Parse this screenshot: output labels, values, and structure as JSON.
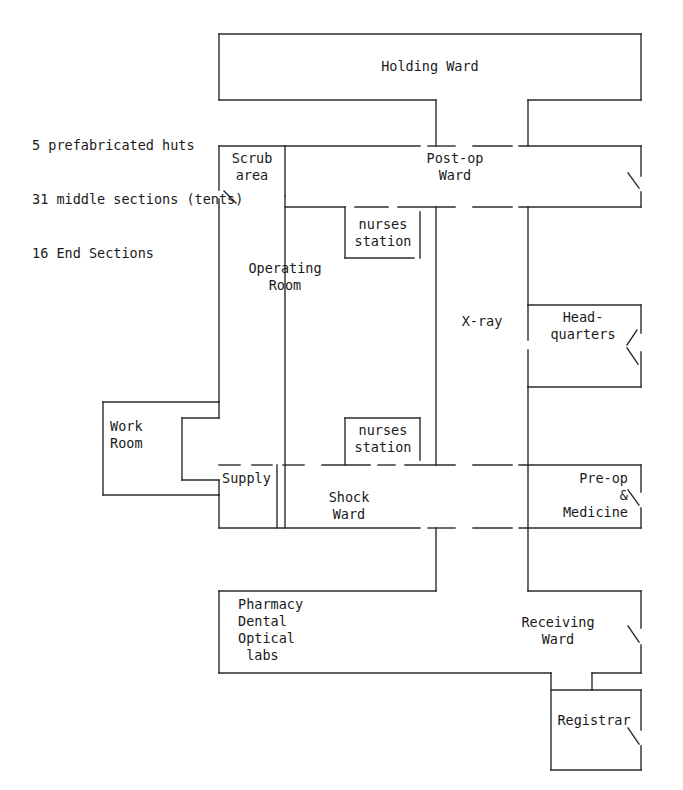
{
  "document": {
    "title": "Hospital Floor Plan",
    "type": "architectural-floor-plan"
  },
  "legend": {
    "lines": [
      "5 prefabricated huts",
      "31 middle sections (tents)",
      "16 End Sections"
    ],
    "line1": "5 prefabricated huts",
    "line2": "31 middle sections (tents)",
    "line3": "16 End Sections"
  },
  "rooms": {
    "holding_ward": "Holding Ward",
    "scrub_area": "Scrub\narea",
    "post_op_ward": "Post-op\nWard",
    "nurses_station_upper": "nurses\nstation",
    "operating_room": "Operating\nRoom",
    "xray": "X-ray",
    "headquarters": "Head-\nquarters",
    "nurses_station_lower": "nurses\nstation",
    "work_room": "Work\nRoom",
    "supply": "Supply",
    "shock_ward": "Shock\nWard",
    "pre_op_medicine": "Pre-op\n&\nMedicine",
    "pharmacy_block": "Pharmacy\nDental\nOptical\n labs",
    "receiving_ward": "Receiving\nWard",
    "registrar": "Registrar"
  },
  "style": {
    "line_color": "#2b2b2b",
    "text_color": "#1a1a1a",
    "background": "#ffffff",
    "stroke_width": "1.4"
  }
}
